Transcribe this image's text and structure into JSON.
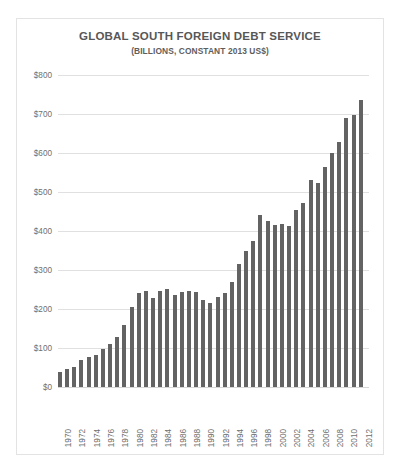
{
  "chart_data": {
    "type": "bar",
    "title": "GLOBAL SOUTH FOREIGN DEBT SERVICE",
    "subtitle": "(BILLIONS, CONSTANT 2013 US$)",
    "xlabel": "",
    "ylabel": "",
    "ylim": [
      0,
      800
    ],
    "ytick_labels": [
      "$0",
      "$100",
      "$200",
      "$300",
      "$400",
      "$500",
      "$600",
      "$700",
      "$800"
    ],
    "ytick_values": [
      0,
      100,
      200,
      300,
      400,
      500,
      600,
      700,
      800
    ],
    "grid": true,
    "legend": "none",
    "bar_color": "#636363",
    "categories": [
      "1970",
      "1971",
      "1972",
      "1973",
      "1974",
      "1975",
      "1976",
      "1977",
      "1978",
      "1979",
      "1980",
      "1981",
      "1982",
      "1983",
      "1984",
      "1985",
      "1986",
      "1987",
      "1988",
      "1989",
      "1990",
      "1991",
      "1992",
      "1993",
      "1994",
      "1995",
      "1996",
      "1997",
      "1998",
      "1999",
      "2000",
      "2001",
      "2002",
      "2003",
      "2004",
      "2005",
      "2006",
      "2007",
      "2008",
      "2009",
      "2010",
      "2011",
      "2012"
    ],
    "xtick_labels": [
      "1970",
      "1972",
      "1974",
      "1976",
      "1978",
      "1980",
      "1982",
      "1984",
      "1986",
      "1988",
      "1990",
      "1992",
      "1994",
      "1996",
      "1998",
      "2000",
      "2002",
      "2004",
      "2006",
      "2008",
      "2010",
      "2012"
    ],
    "values": [
      38,
      45,
      52,
      68,
      78,
      82,
      97,
      110,
      128,
      160,
      205,
      240,
      247,
      228,
      247,
      252,
      236,
      243,
      247,
      244,
      222,
      215,
      232,
      240,
      270,
      315,
      350,
      375,
      440,
      425,
      415,
      418,
      413,
      455,
      473,
      532,
      522,
      565,
      600,
      628,
      690,
      697,
      735
    ],
    "units": "billions of constant 2013 US dollars"
  }
}
